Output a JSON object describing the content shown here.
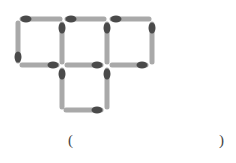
{
  "figure": {
    "stick_color": "#a9a9a9",
    "head_color": "#4a4a4a",
    "stick_width": 5,
    "head_rx": 5.5,
    "head_ry": 3.5,
    "matchsticks": [
      {
        "x1": 22,
        "y1": 19,
        "x2": 60,
        "y2": 19,
        "head": "start"
      },
      {
        "x1": 67,
        "y1": 19,
        "x2": 104,
        "y2": 19,
        "head": "start"
      },
      {
        "x1": 112,
        "y1": 19,
        "x2": 149,
        "y2": 19,
        "head": "start"
      },
      {
        "x1": 18,
        "y1": 23,
        "x2": 18,
        "y2": 61,
        "head": "end"
      },
      {
        "x1": 62,
        "y1": 24,
        "x2": 62,
        "y2": 62,
        "head": "start"
      },
      {
        "x1": 107,
        "y1": 24,
        "x2": 107,
        "y2": 62,
        "head": "start"
      },
      {
        "x1": 152,
        "y1": 24,
        "x2": 152,
        "y2": 62,
        "head": "start"
      },
      {
        "x1": 22,
        "y1": 65,
        "x2": 57,
        "y2": 65,
        "head": "end"
      },
      {
        "x1": 67,
        "y1": 65,
        "x2": 101,
        "y2": 65,
        "head": "end"
      },
      {
        "x1": 112,
        "y1": 65,
        "x2": 146,
        "y2": 65,
        "head": "end"
      },
      {
        "x1": 62,
        "y1": 70,
        "x2": 62,
        "y2": 107,
        "head": "start"
      },
      {
        "x1": 107,
        "y1": 70,
        "x2": 107,
        "y2": 107,
        "head": "start"
      },
      {
        "x1": 66,
        "y1": 110,
        "x2": 101,
        "y2": 110,
        "head": "end"
      }
    ]
  },
  "answer_blank": {
    "open_paren": "(",
    "close_paren": ")"
  }
}
